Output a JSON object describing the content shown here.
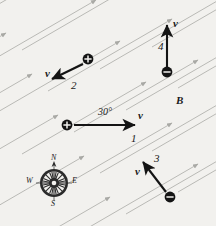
{
  "figure": {
    "name": "magnetic-field-charged-particles-diagram",
    "background_color": "#f2f1ee",
    "width": 216,
    "height": 226,
    "field": {
      "label": "B",
      "label_x": 176,
      "label_y": 101,
      "line_color": "#b9b9b5",
      "angle_degrees": 30,
      "direction": "up-and-to-the-right",
      "num_lines": 13
    },
    "angle_annotation": {
      "text": "30°",
      "x": 98,
      "y": 113
    },
    "particles": [
      {
        "id": "particle-1",
        "number_label": "1",
        "charge_symbol": "+",
        "charge_sign": "positive",
        "charge_x": 67,
        "charge_y": 125,
        "velocity_label": "v",
        "velocity_label_x": 138,
        "velocity_label_y": 115,
        "number_label_x": 131,
        "number_label_y": 138,
        "arrow_from_x": 74,
        "arrow_from_y": 125,
        "arrow_to_x": 135,
        "arrow_to_y": 125
      },
      {
        "id": "particle-2",
        "number_label": "2",
        "charge_symbol": "+",
        "charge_sign": "positive",
        "charge_x": 88,
        "charge_y": 59,
        "velocity_label": "v",
        "velocity_label_x": 45,
        "velocity_label_y": 73,
        "number_label_x": 71,
        "number_label_y": 85,
        "arrow_from_x": 83,
        "arrow_from_y": 64,
        "arrow_to_x": 52,
        "arrow_to_y": 79
      },
      {
        "id": "particle-3",
        "number_label": "3",
        "charge_symbol": "−",
        "charge_sign": "negative",
        "charge_x": 170,
        "charge_y": 197,
        "velocity_label": "v",
        "velocity_label_x": 135,
        "velocity_label_y": 171,
        "number_label_x": 154,
        "number_label_y": 158,
        "arrow_from_x": 166,
        "arrow_from_y": 192,
        "arrow_to_x": 143,
        "arrow_to_y": 162
      },
      {
        "id": "particle-4",
        "number_label": "4",
        "charge_symbol": "−",
        "charge_sign": "negative",
        "charge_x": 167,
        "charge_y": 72,
        "velocity_label": "v",
        "velocity_label_x": 173,
        "velocity_label_y": 23,
        "number_label_x": 158,
        "number_label_y": 46,
        "arrow_from_x": 167,
        "arrow_from_y": 67,
        "arrow_to_x": 167,
        "arrow_to_y": 25
      }
    ],
    "compass": {
      "name": "compass-rose",
      "center_x": 54,
      "center_y": 183,
      "radius": 14,
      "cardinals": [
        {
          "label": "N",
          "x": 51,
          "y": 158
        },
        {
          "label": "E",
          "x": 72,
          "y": 180
        },
        {
          "label": "S",
          "x": 51,
          "y": 203
        },
        {
          "label": "W",
          "x": 28,
          "y": 180
        }
      ]
    }
  }
}
